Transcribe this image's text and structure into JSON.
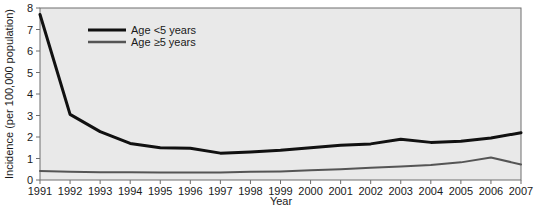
{
  "chart_data": {
    "type": "line",
    "title": "",
    "xlabel": "Year",
    "ylabel": "Incidence (per 100,000 population)",
    "categories": [
      1991,
      1992,
      1993,
      1994,
      1995,
      1996,
      1997,
      1998,
      1999,
      2000,
      2001,
      2002,
      2003,
      2004,
      2005,
      2006,
      2007
    ],
    "x": [
      "1991",
      "1992",
      "1993",
      "1994",
      "1995",
      "1996",
      "1997",
      "1998",
      "1999",
      "2000",
      "2001",
      "2002",
      "2003",
      "2004",
      "2005",
      "2006",
      "2007"
    ],
    "xlim": [
      1991,
      2007
    ],
    "ylim": [
      0,
      8
    ],
    "yticks": [
      0,
      1,
      2,
      3,
      4,
      5,
      6,
      7,
      8
    ],
    "ytick_labels": [
      "0",
      "1",
      "2",
      "3",
      "4",
      "5",
      "6",
      "7",
      "8"
    ],
    "grid": false,
    "legend_position": "upper-left-inside",
    "series": [
      {
        "name": "Age <5 years",
        "color": "#111111",
        "width": 3.0,
        "values": [
          7.7,
          3.05,
          2.25,
          1.7,
          1.5,
          1.48,
          1.25,
          1.3,
          1.38,
          1.5,
          1.62,
          1.68,
          1.9,
          1.75,
          1.8,
          1.95,
          2.2
        ]
      },
      {
        "name": "Age ≥5 years",
        "color": "#555555",
        "width": 2.0,
        "values": [
          0.42,
          0.38,
          0.36,
          0.36,
          0.35,
          0.35,
          0.35,
          0.38,
          0.4,
          0.45,
          0.5,
          0.57,
          0.63,
          0.7,
          0.82,
          1.05,
          0.72
        ]
      }
    ]
  },
  "legend": {
    "entries": [
      {
        "label": "Age <5 years"
      },
      {
        "label": "Age ≥5 years"
      }
    ]
  },
  "axes": {
    "x_title": "Year",
    "y_title": "Incidence (per 100,000 population)"
  },
  "colors": {
    "plot_background": "#e9e9e9",
    "figure_background": "#ffffff",
    "axis_line": "#6e6e6e",
    "series_under5": "#111111",
    "series_over5": "#555555",
    "text": "#1a1a1a"
  }
}
